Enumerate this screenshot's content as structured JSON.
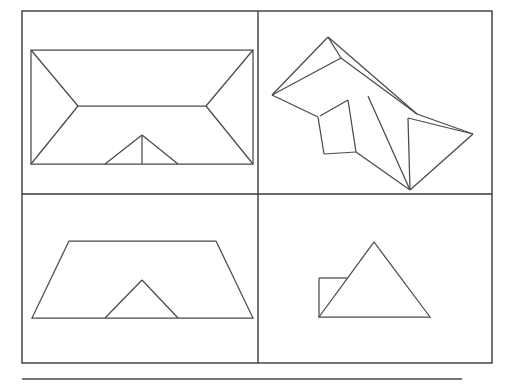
{
  "figure": {
    "background_color": "#ffffff",
    "line_color": "#4a4a4a",
    "frame_color": "#3a3a3a",
    "width": 514,
    "height": 386,
    "frame": {
      "x": 22,
      "y": 11,
      "width": 470,
      "height": 352,
      "stroke_width": 1.4,
      "vertical_divider_x": 258,
      "horizontal_divider_y": 194
    },
    "bottom_rule": {
      "x1": 22,
      "y1": 379,
      "x2": 462,
      "y2": 379,
      "stroke_width": 1.6
    },
    "panels": [
      {
        "name": "top-view",
        "label": "Top view",
        "position": "top-left",
        "shapes": [
          {
            "name": "roof-outline-rectangle",
            "type": "polygon",
            "points": "31,50 253,50 253,164 31,164"
          },
          {
            "name": "hip-ridge-line",
            "type": "polyline",
            "points": "78,106 206,106"
          },
          {
            "name": "hip-left-upper",
            "type": "polyline",
            "points": "31,50 78,106"
          },
          {
            "name": "hip-left-lower",
            "type": "polyline",
            "points": "78,106 31,164"
          },
          {
            "name": "hip-right-upper",
            "type": "polyline",
            "points": "253,50 206,106"
          },
          {
            "name": "hip-right-lower",
            "type": "polyline",
            "points": "206,106 253,164"
          },
          {
            "name": "dormer-left-slope",
            "type": "polyline",
            "points": "105,164 142,135"
          },
          {
            "name": "dormer-right-slope",
            "type": "polyline",
            "points": "142,135 178,164"
          },
          {
            "name": "dormer-center-ridge",
            "type": "polyline",
            "points": "142,135 142,164"
          }
        ]
      },
      {
        "name": "pictorial-view",
        "label": "Pictorial view",
        "position": "top-right",
        "shapes": [
          {
            "name": "main-ridge-line",
            "type": "polyline",
            "points": "328,37 417,114"
          },
          {
            "name": "ridge-to-left-eave",
            "type": "polyline",
            "points": "328,37 272,95"
          },
          {
            "name": "left-hip-edge",
            "type": "polyline",
            "points": "328,37 341,58"
          },
          {
            "name": "left-eave-lower",
            "type": "polyline",
            "points": "272,95 318,117"
          },
          {
            "name": "rear-slope-edge",
            "type": "polyline",
            "points": "341,58 417,114"
          },
          {
            "name": "left-slope-fold",
            "type": "polyline",
            "points": "341,58 272,95"
          },
          {
            "name": "right-ridge-to-apex",
            "type": "polyline",
            "points": "417,114 473,134"
          },
          {
            "name": "rear-eave-to-apex",
            "type": "polyline",
            "points": "408,118 473,134"
          },
          {
            "name": "rear-hip-return",
            "type": "polyline",
            "points": "408,118 410,190"
          },
          {
            "name": "bottom-right-eave",
            "type": "polyline",
            "points": "473,134 410,190"
          },
          {
            "name": "dormer-left-wall",
            "type": "polyline",
            "points": "318,117 324,154"
          },
          {
            "name": "dormer-valley-left",
            "type": "polyline",
            "points": "348,100 356,152"
          },
          {
            "name": "dormer-roof-top",
            "type": "polyline",
            "points": "348,100 320,116"
          },
          {
            "name": "dormer-base-left",
            "type": "polyline",
            "points": "324,154 356,152"
          },
          {
            "name": "front-eave-run",
            "type": "polyline",
            "points": "356,152 410,190"
          },
          {
            "name": "valley-diagonal",
            "type": "polyline",
            "points": "368,96 410,190"
          }
        ]
      },
      {
        "name": "front-elevation",
        "label": "Front elevation",
        "position": "bottom-left",
        "shapes": [
          {
            "name": "roof-trapezoid",
            "type": "polygon",
            "points": "69,241 216,241 253,318 32,318"
          },
          {
            "name": "dormer-triangle-left",
            "type": "polyline",
            "points": "105,318 142,280"
          },
          {
            "name": "dormer-triangle-right",
            "type": "polyline",
            "points": "142,280 178,318"
          }
        ]
      },
      {
        "name": "side-elevation",
        "label": "Side elevation",
        "position": "bottom-right",
        "shapes": [
          {
            "name": "roof-triangle",
            "type": "polygon",
            "points": "319,317 374,242 430,317"
          },
          {
            "name": "dormer-box-left-edge",
            "type": "polyline",
            "points": "319,278 319,317"
          },
          {
            "name": "dormer-box-top-edge",
            "type": "polyline",
            "points": "319,278 347,278"
          }
        ]
      }
    ]
  }
}
